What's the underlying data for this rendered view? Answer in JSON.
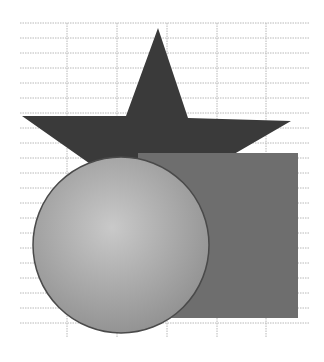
{
  "grid": {
    "x_start": 20,
    "x_end": 310,
    "y_start": 23,
    "y_end": 337,
    "row_spacing": 15,
    "vertical_lines": [
      67,
      117,
      167,
      217,
      266
    ],
    "color": "#b8b8b8"
  },
  "shapes": [
    {
      "type": "star",
      "label": "Star",
      "fill": "#3a3a3a",
      "points": "158,28 188,118 291,121 210,168 150,172 96,168 22,116 126,116"
    },
    {
      "type": "square",
      "label": "Square",
      "fill": "#6e6e6e",
      "x": 138,
      "y": 153,
      "width": 160,
      "height": 165
    },
    {
      "type": "circle",
      "label": "Circle",
      "fill_light": "#c9c9c9",
      "fill_dark": "#8f8f8f",
      "stroke": "#4a4a4a",
      "cx": 121,
      "cy": 245,
      "r": 88
    }
  ]
}
